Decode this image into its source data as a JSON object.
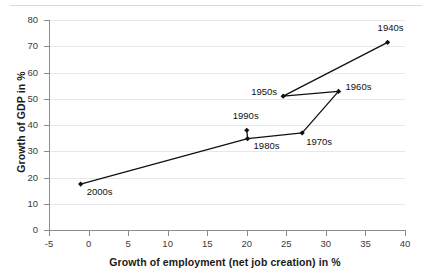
{
  "chart_data": {
    "type": "scatter",
    "title": "",
    "xlabel": "Growth of employment (net job creation) in %",
    "ylabel": "Growth of GDP in %",
    "xlim": [
      -5,
      40
    ],
    "ylim": [
      0,
      80
    ],
    "xticks": [
      -5,
      0,
      5,
      10,
      15,
      20,
      25,
      30,
      35,
      40
    ],
    "yticks": [
      0,
      10,
      20,
      30,
      40,
      50,
      60,
      70,
      80
    ],
    "grid": true,
    "legend": "none",
    "connected": true,
    "marker_color": "#111111",
    "line_color": "#111111",
    "points": [
      {
        "label": "2000s",
        "x": -1.0,
        "y": 17.5,
        "label_dx": 6,
        "label_dy": 8
      },
      {
        "label": "1990s",
        "x": 20.0,
        "y": 38.0,
        "label_dx": -14,
        "label_dy": -14
      },
      {
        "label": "1980s",
        "x": 20.1,
        "y": 34.8,
        "label_dx": 6,
        "label_dy": 7
      },
      {
        "label": "1970s",
        "x": 27.0,
        "y": 37.0,
        "label_dx": 4,
        "label_dy": 9
      },
      {
        "label": "1960s",
        "x": 31.6,
        "y": 52.8,
        "label_dx": 7,
        "label_dy": -4
      },
      {
        "label": "1950s",
        "x": 24.6,
        "y": 51.0,
        "label_dx": -32,
        "label_dy": -4
      },
      {
        "label": "1940s",
        "x": 37.8,
        "y": 71.5,
        "label_dx": -10,
        "label_dy": -14
      }
    ],
    "path_order": [
      "2000s",
      "1980s",
      "1990s",
      "1980s",
      "1970s",
      "1960s",
      "1950s",
      "1940s"
    ]
  },
  "axis": {
    "x_tick_labels": [
      "-5",
      "0",
      "5",
      "10",
      "15",
      "20",
      "25",
      "30",
      "35",
      "40"
    ],
    "y_tick_labels": [
      "0",
      "10",
      "20",
      "30",
      "40",
      "50",
      "60",
      "70",
      "80"
    ]
  }
}
